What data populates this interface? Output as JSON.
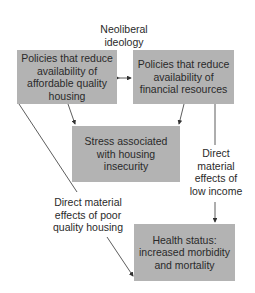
{
  "diagram": {
    "top_label": "Neoliberal\nideology",
    "nodes": {
      "housing_policy": "Policies that reduce availability of affordable quality housing",
      "financial_policy": "Policies that reduce availability of financial resources",
      "stress": "Stress associated with housing insecurity",
      "health": "Health status: increased morbidity and mortality"
    },
    "edge_labels": {
      "low_income": "Direct\nmaterial\neffects of\nlow income",
      "poor_housing": "Direct material\neffects of poor\nquality housing"
    },
    "edges": [
      {
        "from": "housing_policy",
        "to": "financial_policy",
        "type": "bidirectional"
      },
      {
        "from": "housing_policy",
        "to": "stress"
      },
      {
        "from": "financial_policy",
        "to": "stress"
      },
      {
        "from": "financial_policy",
        "to": "health",
        "label": "low_income"
      },
      {
        "from": "housing_policy",
        "to": "health",
        "label": "poor_housing"
      }
    ],
    "colors": {
      "box": "#b3b3b3",
      "line": "#333333",
      "text": "#2a2a2a"
    }
  }
}
